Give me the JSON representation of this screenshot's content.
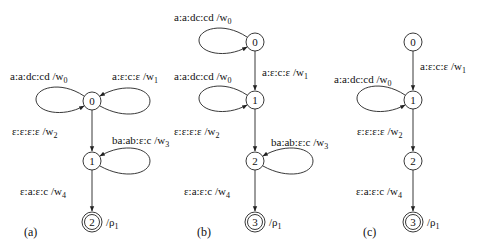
{
  "diagram": {
    "type": "weighted finite-state transducers",
    "panels": [
      {
        "caption": "(a)",
        "states": [
          {
            "id": "0",
            "final": false
          },
          {
            "id": "1",
            "final": false
          },
          {
            "id": "2",
            "final": true,
            "weight": "/ρ",
            "weight_sub": "1"
          }
        ],
        "transitions": [
          {
            "from": "0",
            "to": "0",
            "side": "left",
            "label": "a:a:dc:cd /w",
            "sub": "0"
          },
          {
            "from": "0",
            "to": "0",
            "side": "right",
            "label": "a:ε:c:ε /w",
            "sub": "1"
          },
          {
            "from": "0",
            "to": "1",
            "label": "ε:ε:ε:ε /w",
            "sub": "2"
          },
          {
            "from": "1",
            "to": "1",
            "side": "right",
            "label": "ba:ab:ε:c /w",
            "sub": "3"
          },
          {
            "from": "1",
            "to": "2",
            "label": "ε:a:ε:c /w",
            "sub": "4"
          }
        ]
      },
      {
        "caption": "(b)",
        "states": [
          {
            "id": "0",
            "final": false
          },
          {
            "id": "1",
            "final": false
          },
          {
            "id": "2",
            "final": false
          },
          {
            "id": "3",
            "final": true,
            "weight": "/ρ",
            "weight_sub": "1"
          }
        ],
        "transitions": [
          {
            "from": "0",
            "to": "0",
            "side": "left",
            "label": "a:a:dc:cd /w",
            "sub": "0"
          },
          {
            "from": "0",
            "to": "1",
            "label": "a:ε:c:ε /w",
            "sub": "1"
          },
          {
            "from": "1",
            "to": "1",
            "side": "left",
            "label": "a:a:dc:cd /w",
            "sub": "0"
          },
          {
            "from": "1",
            "to": "2",
            "label": "ε:ε:ε:ε /w",
            "sub": "2"
          },
          {
            "from": "2",
            "to": "2",
            "side": "right",
            "label": "ba:ab:ε:c /w",
            "sub": "3"
          },
          {
            "from": "2",
            "to": "3",
            "label": "ε:a:ε:c /w",
            "sub": "4"
          }
        ]
      },
      {
        "caption": "(c)",
        "states": [
          {
            "id": "0",
            "final": false
          },
          {
            "id": "1",
            "final": false
          },
          {
            "id": "2",
            "final": false
          },
          {
            "id": "3",
            "final": true,
            "weight": "/ρ",
            "weight_sub": "1"
          }
        ],
        "transitions": [
          {
            "from": "0",
            "to": "1",
            "label": "a:ε:c:ε /w",
            "sub": "1"
          },
          {
            "from": "1",
            "to": "1",
            "side": "left",
            "label": "a:a:dc:cd /w",
            "sub": "0"
          },
          {
            "from": "1",
            "to": "2",
            "label": "ε:ε:ε:ε /w",
            "sub": "2"
          },
          {
            "from": "2",
            "to": "3",
            "label": "ε:a:ε:c /w",
            "sub": "4"
          }
        ]
      }
    ]
  }
}
